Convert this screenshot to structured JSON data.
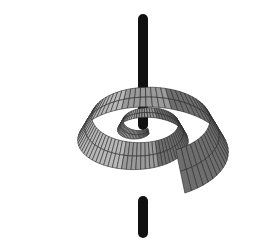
{
  "figure": {
    "colors": {
      "background": "#ffffff",
      "surface_fill": "#9a9a9a",
      "surface_light": "#b8b8b8",
      "surface_dark": "#6e6e6e",
      "mesh_lines": "#2a2a2a",
      "axis_rod": "#111111"
    }
  }
}
